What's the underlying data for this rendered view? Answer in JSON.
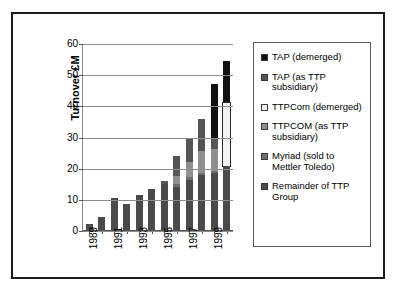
{
  "chart_data": {
    "type": "bar",
    "title": "",
    "subtitle": "",
    "xlabel": "",
    "ylabel": "Turnover £M",
    "ylim": [
      0,
      60
    ],
    "yticks": [
      0,
      10,
      20,
      30,
      40,
      50,
      60
    ],
    "grid": true,
    "stacked": true,
    "legend_position": "right",
    "categories": [
      "1989",
      "1990",
      "1991",
      "1992",
      "1993",
      "1994",
      "1995",
      "1996",
      "1997",
      "1998",
      "1999",
      "2000"
    ],
    "xtick_labels": [
      "1989",
      "",
      "1991",
      "",
      "1993",
      "",
      "1995",
      "",
      "1997",
      "",
      "1999",
      ""
    ],
    "series": [
      {
        "name": "Remainder of TTP Group",
        "color": "#4a4a4a",
        "values": [
          2.0,
          4.3,
          10.2,
          8.4,
          11.3,
          13.2,
          14.8,
          13.7,
          16.2,
          17.5,
          18.4,
          20.6
        ]
      },
      {
        "name": "Myriad (sold to Mettler Toledo)",
        "color": "#6e6e6e",
        "values": [
          0,
          0,
          0,
          0,
          0,
          0,
          0,
          1.1,
          0.9,
          0.7,
          0.5,
          0
        ]
      },
      {
        "name": "TTPCOM (as TTP subsidiary)",
        "color": "#8f8f8f",
        "values": [
          0,
          0,
          0,
          0,
          0,
          0,
          0,
          2.5,
          4.7,
          7.2,
          7.2,
          0
        ]
      },
      {
        "name": "TTPCom (demerged)",
        "color": "#f2f2f2",
        "values": [
          0,
          0,
          0,
          0,
          0,
          0,
          0,
          0,
          0,
          0,
          0,
          20.3
        ]
      },
      {
        "name": "TAP (as TTP subsidiary)",
        "color": "#555555",
        "values": [
          0,
          0,
          0,
          0,
          0,
          0,
          0.9,
          6.3,
          7.7,
          10.3,
          3.0,
          0
        ]
      },
      {
        "name": "TAP (demerged)",
        "color": "#111111",
        "values": [
          0,
          0,
          0,
          0,
          0,
          0,
          0,
          0,
          0,
          0,
          17.8,
          13.4
        ]
      }
    ],
    "legend_entries": [
      {
        "label": "TAP (demerged)",
        "color": "#111111"
      },
      {
        "label": "TAP (as TTP subsidiary)",
        "color": "#555555"
      },
      {
        "label": "TTPCom (demerged)",
        "color": "#f2f2f2"
      },
      {
        "label": "TTPCOM (as TTP subsidiary)",
        "color": "#8f8f8f"
      },
      {
        "label": "Myriad (sold to Mettler Toledo)",
        "color": "#6e6e6e"
      },
      {
        "label": "Remainder of TTP Group",
        "color": "#4a4a4a"
      }
    ],
    "bar_totals": [
      2.0,
      4.3,
      10.2,
      8.4,
      11.3,
      13.2,
      15.7,
      23.6,
      29.5,
      35.7,
      46.9,
      54.3
    ]
  }
}
